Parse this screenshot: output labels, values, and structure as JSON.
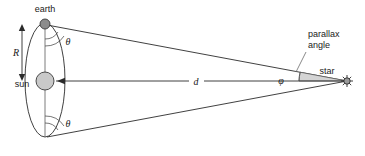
{
  "diagram": {
    "canvas": {
      "width": 365,
      "height": 156,
      "background": "#ffffff"
    },
    "labels": {
      "earth": "earth",
      "sun": "sun",
      "star": "star",
      "parallax_angle_line1": "parallax",
      "parallax_angle_line2": "angle",
      "orbit_radius": "R",
      "distance": "d",
      "theta_top": "θ",
      "theta_bottom": "θ",
      "phi": "φ"
    },
    "elements": {
      "orbit": {
        "name": "earth-orbit-ellipse",
        "center_x": 45,
        "center_y": 80,
        "radius_x": 20,
        "radius_y": 58,
        "stroke": "#2b2b2b"
      },
      "earth_body": {
        "name": "earth-dot",
        "cx": 45,
        "cy": 24,
        "r": 5,
        "fill": "#8c8c8c",
        "stroke": "#3a3a3a"
      },
      "sun_body": {
        "name": "sun-circle",
        "cx": 45,
        "cy": 81,
        "r": 9,
        "fill": "#c9c9c9",
        "stroke": "#3a3a3a"
      },
      "star_body": {
        "name": "star-glyph",
        "cx": 347,
        "cy": 81,
        "r": 3,
        "fill": "#9a9a9a",
        "stroke": "#2b2b2b"
      },
      "sight_line_top": {
        "name": "sight-line-earth-top-to-star",
        "x1": 47,
        "y1": 25,
        "x2": 347,
        "y2": 81
      },
      "sight_line_bottom": {
        "name": "sight-line-earth-bottom-to-star",
        "x1": 47,
        "y1": 137,
        "x2": 347,
        "y2": 81
      },
      "center_line": {
        "name": "sun-to-star-distance-line",
        "x1": 45,
        "y1": 81,
        "x2": 347,
        "y2": 81
      },
      "radius_arrow": {
        "name": "orbit-radius-arrow",
        "x": 22,
        "y_top": 26,
        "y_bottom": 79
      },
      "parallax_sector": {
        "name": "parallax-angle-sector",
        "fill": "#d4d4d4",
        "stroke": "#5a5a5a"
      }
    },
    "accent_colors": {
      "line": "#2b2b2b",
      "text": "#1a1a1a",
      "sun_fill": "#c9c9c9",
      "earth_fill": "#8c8c8c",
      "sector_fill": "#d4d4d4"
    }
  }
}
